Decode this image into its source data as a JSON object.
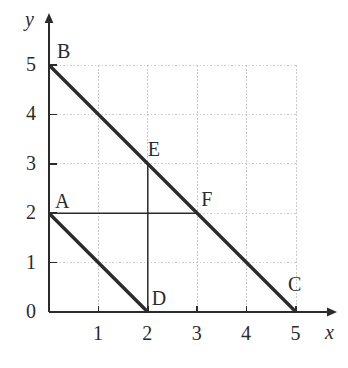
{
  "figure": {
    "kind": "coordinate-geometry-diagram",
    "background_color": "#ffffff",
    "ink_color": "#2b2b2b",
    "grid_color": "#c9c9c9"
  },
  "axes": {
    "x_label": "x",
    "y_label": "y",
    "origin_label": "0",
    "x_ticks": [
      "1",
      "2",
      "3",
      "4",
      "5"
    ],
    "y_ticks": [
      "1",
      "2",
      "3",
      "4",
      "5"
    ],
    "x_tick_values": [
      1,
      2,
      3,
      4,
      5
    ],
    "y_tick_values": [
      1,
      2,
      3,
      4,
      5
    ],
    "x_range": [
      0,
      5.8
    ],
    "y_range": [
      0,
      6.05
    ],
    "arrow_x": true,
    "arrow_y": true
  },
  "chart_data": {
    "type": "scatter",
    "title": "",
    "xlabel": "x",
    "ylabel": "y",
    "xlim": [
      0,
      5.8
    ],
    "ylim": [
      0,
      6.05
    ],
    "grid": true,
    "legend": null,
    "points": [
      {
        "label": "A",
        "x": 0,
        "y": 2,
        "label_dx": 6,
        "label_dy": -22
      },
      {
        "label": "B",
        "x": 0,
        "y": 5,
        "label_dx": 8,
        "label_dy": -24
      },
      {
        "label": "C",
        "x": 5,
        "y": 0,
        "label_dx": -8,
        "label_dy": -38
      },
      {
        "label": "D",
        "x": 2,
        "y": 0,
        "label_dx": 4,
        "label_dy": -24
      },
      {
        "label": "E",
        "x": 2,
        "y": 3,
        "label_dx": 0,
        "label_dy": -25
      },
      {
        "label": "F",
        "x": 3,
        "y": 2,
        "label_dx": 4,
        "label_dy": -24
      }
    ],
    "segments": [
      {
        "name": "BC",
        "from": "B",
        "to": "C",
        "x1": 0,
        "y1": 5,
        "x2": 5,
        "y2": 0,
        "weight": "thick"
      },
      {
        "name": "AD",
        "from": "A",
        "to": "D",
        "x1": 0,
        "y1": 2,
        "x2": 2,
        "y2": 0,
        "weight": "thick"
      },
      {
        "name": "ED",
        "from": "E",
        "to": "D",
        "x1": 2,
        "y1": 3,
        "x2": 2,
        "y2": 0,
        "weight": "thin"
      },
      {
        "name": "AF",
        "from": "A",
        "to": "F",
        "x1": 0,
        "y1": 2,
        "x2": 3,
        "y2": 2,
        "weight": "thin"
      }
    ]
  }
}
